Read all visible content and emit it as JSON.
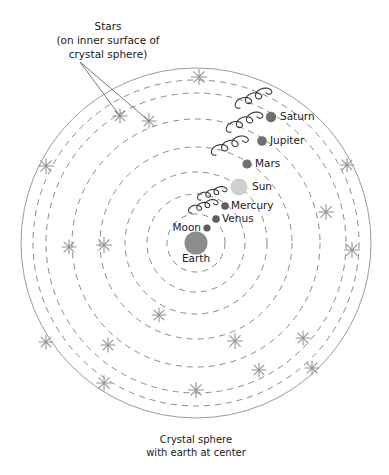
{
  "figure": {
    "background_color": "#ffffff",
    "center": {
      "x": 196,
      "y": 243
    },
    "colors": {
      "orbit_stroke": "#8a8a8a",
      "sphere_stroke": "#9a9a9a",
      "star_stroke": "#8f8f9a",
      "epicycle_stroke": "#3a3a3a",
      "earth_fill": "#8c8c8c",
      "sun_fill": "#cfcfcf",
      "planet_fill": "#6f6f6f",
      "text_color": "#1a1a1a",
      "leader_stroke": "#555555"
    }
  },
  "annotations": {
    "stars_note": {
      "lines": [
        "Stars",
        "(on inner surface of",
        "crystal sphere)"
      ],
      "anchor": {
        "x": 108,
        "y": 30
      },
      "leader_origin": {
        "x": 80,
        "y": 62
      },
      "leader_targets": [
        {
          "x": 120,
          "y": 116
        },
        {
          "x": 149,
          "y": 121
        }
      ]
    },
    "caption": {
      "lines": [
        "Crystal sphere",
        "with earth at center"
      ],
      "anchor": {
        "x": 196,
        "y": 443
      }
    }
  },
  "crystal_sphere": {
    "label": "Crystal sphere",
    "radius": 175,
    "style": "solid"
  },
  "orbits": [
    {
      "name": "moon-orbit",
      "radius": 29,
      "style": "dashed"
    },
    {
      "name": "venus-orbit",
      "radius": 49,
      "style": "dashed"
    },
    {
      "name": "mercury-orbit",
      "radius": 71,
      "style": "dashed"
    },
    {
      "name": "sun-orbit",
      "radius": 96,
      "style": "dashed"
    },
    {
      "name": "mars-orbit",
      "radius": 124,
      "style": "dashed"
    },
    {
      "name": "jupiter-orbit",
      "radius": 150,
      "style": "dashed"
    },
    {
      "name": "saturn-orbit",
      "radius": 163,
      "style": "dashed"
    }
  ],
  "bodies": [
    {
      "name": "earth",
      "label": "Earth",
      "x": 196,
      "y": 243,
      "radius": 11.5,
      "fill": "#8c8c8c",
      "label_x": 196,
      "label_y": 262,
      "label_anchor": "middle",
      "epicycle": false
    },
    {
      "name": "moon",
      "label": "Moon",
      "x": 207,
      "y": 228,
      "radius": 3.6,
      "fill": "#5e5e5e",
      "label_x": 201,
      "label_y": 231,
      "label_anchor": "end",
      "epicycle": false
    },
    {
      "name": "venus",
      "label": "Venus",
      "x": 216,
      "y": 219,
      "radius": 3.8,
      "fill": "#5e5e5e",
      "label_x": 222,
      "label_y": 222,
      "label_anchor": "start",
      "epicycle": true,
      "epicycle_rotation": -28,
      "epicycle_scale": 0.78,
      "epicycle_offset": {
        "x": -24,
        "y": -6
      }
    },
    {
      "name": "mercury",
      "label": "Mercury",
      "x": 225,
      "y": 206,
      "radius": 3.8,
      "fill": "#5e5e5e",
      "label_x": 231,
      "label_y": 209,
      "label_anchor": "start",
      "epicycle": true,
      "epicycle_rotation": -28,
      "epicycle_scale": 0.78,
      "epicycle_offset": {
        "x": -24,
        "y": -6
      }
    },
    {
      "name": "sun",
      "label": "Sun",
      "x": 239,
      "y": 187,
      "radius": 8.5,
      "fill": "#cfcfcf",
      "label_x": 252,
      "label_y": 190,
      "label_anchor": "start",
      "epicycle": false
    },
    {
      "name": "mars",
      "label": "Mars",
      "x": 247,
      "y": 164,
      "radius": 4.6,
      "fill": "#6f6f6f",
      "label_x": 255,
      "label_y": 167,
      "label_anchor": "start",
      "epicycle": true,
      "epicycle_rotation": -32,
      "epicycle_scale": 1.0,
      "epicycle_offset": {
        "x": -31,
        "y": -9
      }
    },
    {
      "name": "jupiter",
      "label": "Jupiter",
      "x": 262,
      "y": 141,
      "radius": 4.8,
      "fill": "#6f6f6f",
      "label_x": 270,
      "label_y": 144,
      "label_anchor": "start",
      "epicycle": true,
      "epicycle_rotation": -34,
      "epicycle_scale": 1.0,
      "epicycle_offset": {
        "x": -31,
        "y": -9
      }
    },
    {
      "name": "saturn",
      "label": "Saturn",
      "x": 271,
      "y": 117,
      "radius": 5.2,
      "fill": "#6f6f6f",
      "label_x": 280,
      "label_y": 120,
      "label_anchor": "start",
      "epicycle": true,
      "epicycle_rotation": -34,
      "epicycle_scale": 1.0,
      "epicycle_offset": {
        "x": -31,
        "y": -9
      }
    }
  ],
  "stars": [
    {
      "x": 199,
      "y": 77,
      "size": 7.5
    },
    {
      "x": 120,
      "y": 116,
      "size": 7.0
    },
    {
      "x": 149,
      "y": 121,
      "size": 7.0
    },
    {
      "x": 46,
      "y": 166,
      "size": 7.5
    },
    {
      "x": 347,
      "y": 165,
      "size": 7.0
    },
    {
      "x": 326,
      "y": 212,
      "size": 7.5
    },
    {
      "x": 104,
      "y": 245,
      "size": 7.5
    },
    {
      "x": 69,
      "y": 247,
      "size": 7.0
    },
    {
      "x": 352,
      "y": 250,
      "size": 7.5
    },
    {
      "x": 159,
      "y": 315,
      "size": 7.0
    },
    {
      "x": 235,
      "y": 341,
      "size": 7.5
    },
    {
      "x": 46,
      "y": 342,
      "size": 7.0
    },
    {
      "x": 303,
      "y": 338,
      "size": 7.0
    },
    {
      "x": 104,
      "y": 383,
      "size": 7.5
    },
    {
      "x": 196,
      "y": 390,
      "size": 7.5
    },
    {
      "x": 259,
      "y": 370,
      "size": 7.0
    },
    {
      "x": 312,
      "y": 368,
      "size": 7.0
    },
    {
      "x": 108,
      "y": 345,
      "size": 7.0
    }
  ]
}
